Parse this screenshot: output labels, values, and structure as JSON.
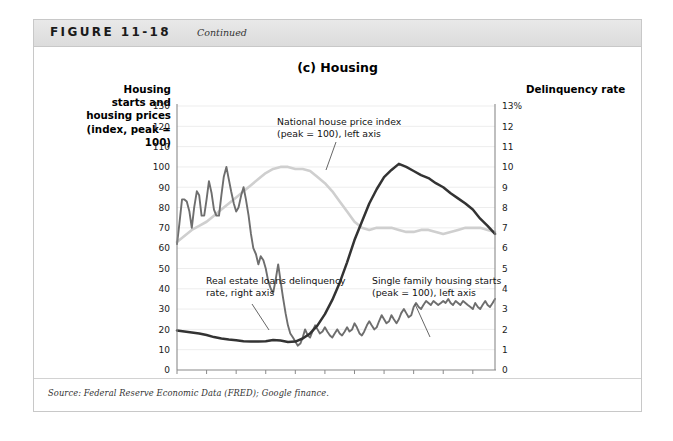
{
  "figure": {
    "label": "FIGURE 11-18",
    "continued": "Continued",
    "source": "Source: Federal Reserve Economic Data (FRED); Google finance."
  },
  "chart_data": {
    "type": "line",
    "title": "(c) Housing",
    "xlabel": "",
    "ylabel": "Housing starts and housing prices (index, peak = 100)",
    "y2label": "Delinquency rate",
    "ylim": [
      0,
      130
    ],
    "y2lim": [
      0,
      13
    ],
    "xlim": [
      2003,
      2013.75
    ],
    "grid": true,
    "legend_position": "inline-annotations",
    "left_axis_title": "Housing starts and housing prices (index, peak = 100)",
    "right_axis_title": "Delinquency rate",
    "xticks": [
      "2003",
      "2004",
      "2005",
      "2006",
      "2007",
      "2008",
      "2009",
      "2010",
      "2011",
      "2012",
      "2013"
    ],
    "yticks": [
      "130",
      "120",
      "110",
      "100",
      "90",
      "80",
      "70",
      "60",
      "50",
      "40",
      "30",
      "20",
      "10",
      "0"
    ],
    "y2ticks": [
      "13%",
      "12",
      "11",
      "10",
      "9",
      "8",
      "7",
      "6",
      "5",
      "4",
      "3",
      "2",
      "1",
      "0"
    ],
    "annotations": [
      {
        "id": "price",
        "text_line1": "National house price index",
        "text_line2": "(peak = 100), left axis"
      },
      {
        "id": "delinquency",
        "text_line1": "Real estate loans delinquency",
        "text_line2": "rate, right axis"
      },
      {
        "id": "starts",
        "text_line1": "Single family housing starts",
        "text_line2": "(peak = 100), left axis"
      }
    ],
    "series": [
      {
        "name": "National house price index (peak = 100), left axis",
        "axis": "left",
        "color": "#cfcfcf",
        "values": [
          [
            2003.0,
            63
          ],
          [
            2003.25,
            66
          ],
          [
            2003.5,
            69
          ],
          [
            2003.75,
            71
          ],
          [
            2004.0,
            73
          ],
          [
            2004.25,
            76
          ],
          [
            2004.5,
            79
          ],
          [
            2004.75,
            82
          ],
          [
            2005.0,
            85
          ],
          [
            2005.25,
            88
          ],
          [
            2005.5,
            91
          ],
          [
            2005.75,
            94
          ],
          [
            2006.0,
            97
          ],
          [
            2006.25,
            99
          ],
          [
            2006.5,
            100
          ],
          [
            2006.75,
            100
          ],
          [
            2007.0,
            99
          ],
          [
            2007.25,
            99
          ],
          [
            2007.5,
            98
          ],
          [
            2007.75,
            95
          ],
          [
            2008.0,
            92
          ],
          [
            2008.25,
            88
          ],
          [
            2008.5,
            83
          ],
          [
            2008.75,
            78
          ],
          [
            2009.0,
            73
          ],
          [
            2009.25,
            70
          ],
          [
            2009.5,
            69
          ],
          [
            2009.75,
            70
          ],
          [
            2010.0,
            70
          ],
          [
            2010.25,
            70
          ],
          [
            2010.5,
            69
          ],
          [
            2010.75,
            68
          ],
          [
            2011.0,
            68
          ],
          [
            2011.25,
            69
          ],
          [
            2011.5,
            69
          ],
          [
            2011.75,
            68
          ],
          [
            2012.0,
            67
          ],
          [
            2012.25,
            68
          ],
          [
            2012.5,
            69
          ],
          [
            2012.75,
            70
          ],
          [
            2013.0,
            70
          ],
          [
            2013.25,
            70
          ],
          [
            2013.5,
            69
          ],
          [
            2013.75,
            68
          ]
        ]
      },
      {
        "name": "Single family housing starts (peak = 100), left axis",
        "axis": "left",
        "color": "#6e6e6e",
        "values": [
          [
            2003.0,
            62
          ],
          [
            2003.08,
            72
          ],
          [
            2003.17,
            84
          ],
          [
            2003.25,
            84
          ],
          [
            2003.33,
            83
          ],
          [
            2003.42,
            78
          ],
          [
            2003.5,
            70
          ],
          [
            2003.58,
            80
          ],
          [
            2003.67,
            88
          ],
          [
            2003.75,
            86
          ],
          [
            2003.83,
            76
          ],
          [
            2003.92,
            76
          ],
          [
            2004.0,
            84
          ],
          [
            2004.08,
            93
          ],
          [
            2004.17,
            87
          ],
          [
            2004.25,
            79
          ],
          [
            2004.33,
            76
          ],
          [
            2004.42,
            76
          ],
          [
            2004.5,
            86
          ],
          [
            2004.58,
            95
          ],
          [
            2004.67,
            100
          ],
          [
            2004.75,
            94
          ],
          [
            2004.83,
            88
          ],
          [
            2004.92,
            82
          ],
          [
            2005.0,
            78
          ],
          [
            2005.08,
            80
          ],
          [
            2005.17,
            86
          ],
          [
            2005.25,
            90
          ],
          [
            2005.33,
            84
          ],
          [
            2005.42,
            76
          ],
          [
            2005.5,
            67
          ],
          [
            2005.58,
            60
          ],
          [
            2005.67,
            57
          ],
          [
            2005.75,
            52
          ],
          [
            2005.83,
            56
          ],
          [
            2005.92,
            54
          ],
          [
            2006.0,
            50
          ],
          [
            2006.08,
            44
          ],
          [
            2006.17,
            40
          ],
          [
            2006.25,
            38
          ],
          [
            2006.33,
            44
          ],
          [
            2006.42,
            52
          ],
          [
            2006.5,
            44
          ],
          [
            2006.58,
            36
          ],
          [
            2006.67,
            28
          ],
          [
            2006.75,
            22
          ],
          [
            2006.83,
            18
          ],
          [
            2006.92,
            16
          ],
          [
            2007.0,
            14
          ],
          [
            2007.08,
            12
          ],
          [
            2007.17,
            13
          ],
          [
            2007.25,
            16
          ],
          [
            2007.33,
            20
          ],
          [
            2007.42,
            17
          ],
          [
            2007.5,
            16
          ],
          [
            2007.58,
            19
          ],
          [
            2007.67,
            22
          ],
          [
            2007.75,
            20
          ],
          [
            2007.83,
            18
          ],
          [
            2007.92,
            19
          ],
          [
            2008.0,
            21
          ],
          [
            2008.08,
            19
          ],
          [
            2008.17,
            17
          ],
          [
            2008.25,
            16
          ],
          [
            2008.33,
            18
          ],
          [
            2008.42,
            20
          ],
          [
            2008.5,
            18
          ],
          [
            2008.58,
            17
          ],
          [
            2008.67,
            19
          ],
          [
            2008.75,
            21
          ],
          [
            2008.83,
            19
          ],
          [
            2008.92,
            20
          ],
          [
            2009.0,
            23
          ],
          [
            2009.08,
            21
          ],
          [
            2009.17,
            18
          ],
          [
            2009.25,
            17
          ],
          [
            2009.33,
            19
          ],
          [
            2009.42,
            22
          ],
          [
            2009.5,
            24
          ],
          [
            2009.58,
            22
          ],
          [
            2009.67,
            20
          ],
          [
            2009.75,
            21
          ],
          [
            2009.83,
            24
          ],
          [
            2009.92,
            27
          ],
          [
            2010.0,
            25
          ],
          [
            2010.08,
            23
          ],
          [
            2010.17,
            24
          ],
          [
            2010.25,
            27
          ],
          [
            2010.33,
            25
          ],
          [
            2010.42,
            23
          ],
          [
            2010.5,
            25
          ],
          [
            2010.58,
            28
          ],
          [
            2010.67,
            30
          ],
          [
            2010.75,
            28
          ],
          [
            2010.83,
            26
          ],
          [
            2010.92,
            27
          ],
          [
            2011.0,
            31
          ],
          [
            2011.08,
            33
          ],
          [
            2011.17,
            31
          ],
          [
            2011.25,
            30
          ],
          [
            2011.33,
            32
          ],
          [
            2011.42,
            34
          ],
          [
            2011.5,
            33
          ],
          [
            2011.58,
            32
          ],
          [
            2011.67,
            34
          ],
          [
            2011.75,
            33
          ],
          [
            2011.83,
            32
          ],
          [
            2011.92,
            33
          ],
          [
            2012.0,
            34
          ],
          [
            2012.08,
            33
          ],
          [
            2012.17,
            35
          ],
          [
            2012.25,
            33
          ],
          [
            2012.33,
            32
          ],
          [
            2012.42,
            34
          ],
          [
            2012.5,
            33
          ],
          [
            2012.58,
            32
          ],
          [
            2012.67,
            34
          ],
          [
            2012.75,
            33
          ],
          [
            2012.83,
            32
          ],
          [
            2012.92,
            31
          ],
          [
            2013.0,
            30
          ],
          [
            2013.08,
            33
          ],
          [
            2013.17,
            31
          ],
          [
            2013.25,
            30
          ],
          [
            2013.33,
            32
          ],
          [
            2013.42,
            34
          ],
          [
            2013.5,
            32
          ],
          [
            2013.58,
            31
          ],
          [
            2013.67,
            33
          ],
          [
            2013.75,
            35
          ]
        ]
      },
      {
        "name": "Real estate loans delinquency rate, right axis",
        "axis": "right",
        "color": "#333333",
        "values": [
          [
            2003.0,
            1.95
          ],
          [
            2003.25,
            1.9
          ],
          [
            2003.5,
            1.85
          ],
          [
            2003.75,
            1.8
          ],
          [
            2004.0,
            1.72
          ],
          [
            2004.25,
            1.62
          ],
          [
            2004.5,
            1.55
          ],
          [
            2004.75,
            1.5
          ],
          [
            2005.0,
            1.46
          ],
          [
            2005.25,
            1.42
          ],
          [
            2005.5,
            1.4
          ],
          [
            2005.75,
            1.4
          ],
          [
            2006.0,
            1.42
          ],
          [
            2006.25,
            1.48
          ],
          [
            2006.5,
            1.45
          ],
          [
            2006.75,
            1.38
          ],
          [
            2007.0,
            1.4
          ],
          [
            2007.25,
            1.55
          ],
          [
            2007.5,
            1.8
          ],
          [
            2007.75,
            2.2
          ],
          [
            2008.0,
            2.75
          ],
          [
            2008.25,
            3.45
          ],
          [
            2008.5,
            4.3
          ],
          [
            2008.75,
            5.3
          ],
          [
            2009.0,
            6.4
          ],
          [
            2009.25,
            7.3
          ],
          [
            2009.5,
            8.2
          ],
          [
            2009.75,
            8.9
          ],
          [
            2010.0,
            9.5
          ],
          [
            2010.25,
            9.85
          ],
          [
            2010.5,
            10.15
          ],
          [
            2010.75,
            10.0
          ],
          [
            2011.0,
            9.8
          ],
          [
            2011.25,
            9.6
          ],
          [
            2011.5,
            9.45
          ],
          [
            2011.75,
            9.2
          ],
          [
            2012.0,
            9.0
          ],
          [
            2012.25,
            8.7
          ],
          [
            2012.5,
            8.45
          ],
          [
            2012.75,
            8.2
          ],
          [
            2013.0,
            7.9
          ],
          [
            2013.25,
            7.45
          ],
          [
            2013.5,
            7.1
          ],
          [
            2013.75,
            6.7
          ]
        ]
      }
    ]
  }
}
